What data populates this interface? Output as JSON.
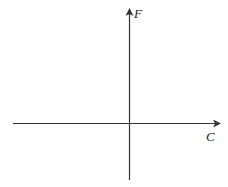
{
  "diagram": {
    "type": "coordinate-axes",
    "axes": {
      "vertical": {
        "label": "F",
        "direction": "up"
      },
      "horizontal": {
        "label": "C",
        "direction": "right"
      }
    },
    "colors": {
      "axis": "#333333",
      "background": "#ffffff",
      "label": "#222222"
    }
  }
}
